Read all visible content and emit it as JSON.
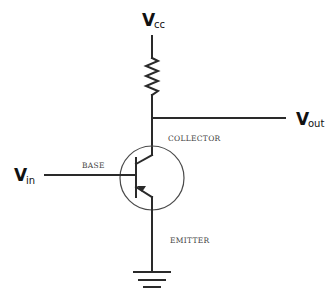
{
  "diagram": {
    "type": "circuit-schematic",
    "labels": {
      "vcc": {
        "main": "V",
        "sub": "cc"
      },
      "vout": {
        "main": "V",
        "sub": "out"
      },
      "vin": {
        "main": "V",
        "sub": "in"
      },
      "collector": "COLLECTOR",
      "base": "BASE",
      "emitter": "EMITTER"
    },
    "components": [
      {
        "id": "resistor",
        "kind": "resistor",
        "between": [
          "Vcc",
          "collector-node"
        ]
      },
      {
        "id": "transistor",
        "kind": "bipolar-junction-transistor",
        "terminals": [
          "collector",
          "base",
          "emitter"
        ]
      },
      {
        "id": "ground",
        "kind": "ground"
      }
    ],
    "colors": {
      "wire": "#2a2a2a",
      "circle": "#4a4a4a",
      "text": "#111111",
      "terminal_text": "#444444"
    }
  }
}
